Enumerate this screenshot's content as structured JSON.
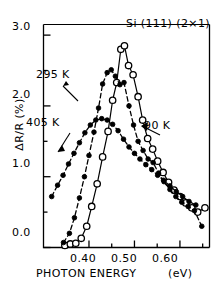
{
  "figure": {
    "panel_title": "Si (111) (2×1)",
    "background_color": "#ffffff",
    "line_color": "#000000"
  },
  "axes": {
    "y_label": "ΔR/R (%)",
    "x_label_main": "PHOTON  ENERGY",
    "x_label_unit": "(eV)",
    "y_ticks": [
      "0.0",
      "1.0",
      "2.0",
      "3.0"
    ],
    "x_ticks": [
      "0.40",
      "0.50",
      "0.60"
    ]
  },
  "annotations": [
    {
      "label": "295 K",
      "target_series": "295 K"
    },
    {
      "label": "405 K",
      "target_series": "405 K"
    },
    {
      "label": "90 K",
      "target_series": "90 K"
    }
  ],
  "chart_data": {
    "type": "line",
    "title": "Si (111) (2×1)",
    "xlabel": "PHOTON ENERGY (eV)",
    "ylabel": "ΔR/R (%)",
    "xlim": [
      0.3,
      0.665
    ],
    "ylim": [
      0.0,
      3.15
    ],
    "x_major_ticks": [
      0.4,
      0.5,
      0.6
    ],
    "x_minor_ticks": [
      0.35,
      0.45,
      0.55,
      0.65
    ],
    "y_major_ticks": [
      0.0,
      1.0,
      2.0,
      3.0
    ],
    "y_minor_ticks": [
      0.5,
      1.5,
      2.5
    ],
    "grid": false,
    "legend": "inline-annotations",
    "series": [
      {
        "name": "90 K",
        "marker": "open-circle",
        "linestyle": "solid",
        "points": [
          [
            0.347,
            0.03
          ],
          [
            0.359,
            0.05
          ],
          [
            0.371,
            0.06
          ],
          [
            0.383,
            0.13
          ],
          [
            0.395,
            0.3
          ],
          [
            0.406,
            0.58
          ],
          [
            0.418,
            0.9
          ],
          [
            0.43,
            1.28
          ],
          [
            0.442,
            1.64
          ],
          [
            0.452,
            2.08
          ],
          [
            0.461,
            2.33
          ],
          [
            0.47,
            2.8
          ],
          [
            0.478,
            2.85
          ],
          [
            0.487,
            2.57
          ],
          [
            0.497,
            2.44
          ],
          [
            0.508,
            2.13
          ],
          [
            0.518,
            1.8
          ],
          [
            0.529,
            1.54
          ],
          [
            0.54,
            1.39
          ],
          [
            0.551,
            1.22
          ],
          [
            0.563,
            1.06
          ],
          [
            0.575,
            0.92
          ],
          [
            0.587,
            0.81
          ],
          [
            0.6,
            0.72
          ],
          [
            0.613,
            0.63
          ],
          [
            0.626,
            0.56
          ],
          [
            0.639,
            0.5
          ],
          [
            0.655,
            0.56
          ]
        ]
      },
      {
        "name": "295 K",
        "marker": "filled-circle",
        "linestyle": "dashed",
        "points": [
          [
            0.344,
            0.07
          ],
          [
            0.357,
            0.2
          ],
          [
            0.368,
            0.42
          ],
          [
            0.379,
            0.7
          ],
          [
            0.39,
            1.0
          ],
          [
            0.4,
            1.3
          ],
          [
            0.411,
            1.63
          ],
          [
            0.421,
            1.97
          ],
          [
            0.43,
            2.31
          ],
          [
            0.44,
            2.47
          ],
          [
            0.449,
            2.51
          ],
          [
            0.458,
            2.42
          ],
          [
            0.468,
            2.3
          ],
          [
            0.477,
            2.33
          ],
          [
            0.488,
            2.0
          ],
          [
            0.498,
            1.73
          ],
          [
            0.508,
            1.5
          ],
          [
            0.519,
            1.37
          ],
          [
            0.53,
            1.25
          ],
          [
            0.541,
            1.2
          ],
          [
            0.553,
            1.05
          ],
          [
            0.565,
            0.93
          ],
          [
            0.578,
            0.82
          ],
          [
            0.591,
            0.72
          ],
          [
            0.604,
            0.64
          ],
          [
            0.618,
            0.58
          ],
          [
            0.632,
            0.52
          ],
          [
            0.648,
            0.3
          ]
        ]
      },
      {
        "name": "405 K",
        "marker": "filled-circle",
        "linestyle": "dashed",
        "points": [
          [
            0.318,
            0.72
          ],
          [
            0.331,
            0.88
          ],
          [
            0.343,
            1.02
          ],
          [
            0.355,
            1.18
          ],
          [
            0.367,
            1.33
          ],
          [
            0.379,
            1.48
          ],
          [
            0.391,
            1.62
          ],
          [
            0.403,
            1.73
          ],
          [
            0.415,
            1.8
          ],
          [
            0.428,
            1.82
          ],
          [
            0.44,
            1.8
          ],
          [
            0.452,
            1.74
          ],
          [
            0.464,
            1.65
          ],
          [
            0.476,
            1.53
          ],
          [
            0.488,
            1.42
          ],
          [
            0.5,
            1.33
          ],
          [
            0.512,
            1.25
          ],
          [
            0.525,
            1.17
          ],
          [
            0.538,
            1.1
          ],
          [
            0.551,
            1.02
          ],
          [
            0.564,
            0.95
          ],
          [
            0.578,
            0.87
          ],
          [
            0.592,
            0.79
          ],
          [
            0.606,
            0.72
          ],
          [
            0.62,
            0.65
          ],
          [
            0.635,
            0.6
          ]
        ]
      }
    ]
  }
}
